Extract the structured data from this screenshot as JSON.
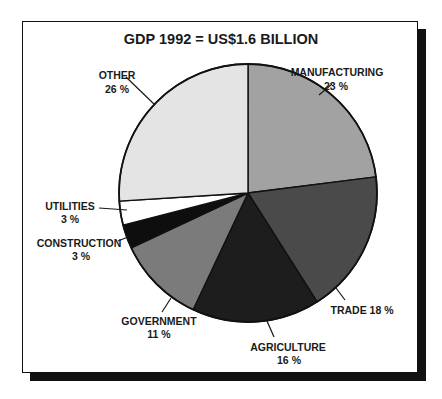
{
  "chart_data": {
    "type": "pie",
    "title": "GDP 1992 = US$1.6 BILLION",
    "start_angle_deg": 0,
    "direction": "clockwise",
    "unit": "%",
    "slices": [
      {
        "label": "MANUFACTURING",
        "value": 23,
        "value_text": "23 %",
        "color": "#a2a2a2"
      },
      {
        "label": "TRADE",
        "value": 18,
        "value_text": "TRADE 18 %",
        "color": "#4a4a4a"
      },
      {
        "label": "AGRICULTURE",
        "value": 16,
        "value_text": "16 %",
        "color": "#1d1d1d"
      },
      {
        "label": "GOVERNMENT",
        "value": 11,
        "value_text": "11 %",
        "color": "#7b7b7b"
      },
      {
        "label": "CONSTRUCTION",
        "value": 3,
        "value_text": "3 %",
        "color": "#0e0e0e"
      },
      {
        "label": "UTILITIES",
        "value": 3,
        "value_text": "3 %",
        "color": "#ffffff"
      },
      {
        "label": "OTHER",
        "value": 26,
        "value_text": "26 %",
        "color": "#e4e4e4"
      }
    ],
    "legend": "none (direct labels with leader lines)"
  },
  "labels": {
    "manufacturing": {
      "name": "MANUFACTURING",
      "pct": "23 %"
    },
    "trade": {
      "combined": "TRADE 18 %"
    },
    "agriculture": {
      "name": "AGRICULTURE",
      "pct": "16 %"
    },
    "government": {
      "name": "GOVERNMENT",
      "pct": "11 %"
    },
    "construction": {
      "name": "CONSTRUCTION",
      "pct": "3 %"
    },
    "utilities": {
      "name": "UTILITIES",
      "pct": "3 %"
    },
    "other": {
      "name": "OTHER",
      "pct": "26 %"
    }
  },
  "colors": {
    "frame_border": "#111111",
    "shadow": "#111111",
    "text": "#1a1a1a",
    "outline": "#111111"
  }
}
